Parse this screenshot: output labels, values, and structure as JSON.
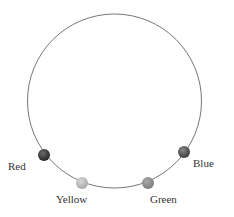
{
  "diagram": {
    "circle": {
      "cx": 114.5,
      "cy": 101,
      "r": 87,
      "stroke": "#777777"
    },
    "beads": [
      {
        "name": "Red",
        "label": "Red",
        "x": 44,
        "y": 155,
        "fill": "#3a3a3a",
        "label_x": 8,
        "label_y": 158
      },
      {
        "name": "Yellow",
        "label": "Yellow",
        "x": 82,
        "y": 183,
        "fill": "#b8b8b8",
        "label_x": 57,
        "label_y": 191
      },
      {
        "name": "Green",
        "label": "Green",
        "x": 148,
        "y": 183,
        "fill": "#8e8e8e",
        "label_x": 150,
        "label_y": 191
      },
      {
        "name": "Blue",
        "label": "Blue",
        "x": 184,
        "y": 152,
        "fill": "#555555",
        "label_x": 193,
        "label_y": 156
      }
    ]
  }
}
